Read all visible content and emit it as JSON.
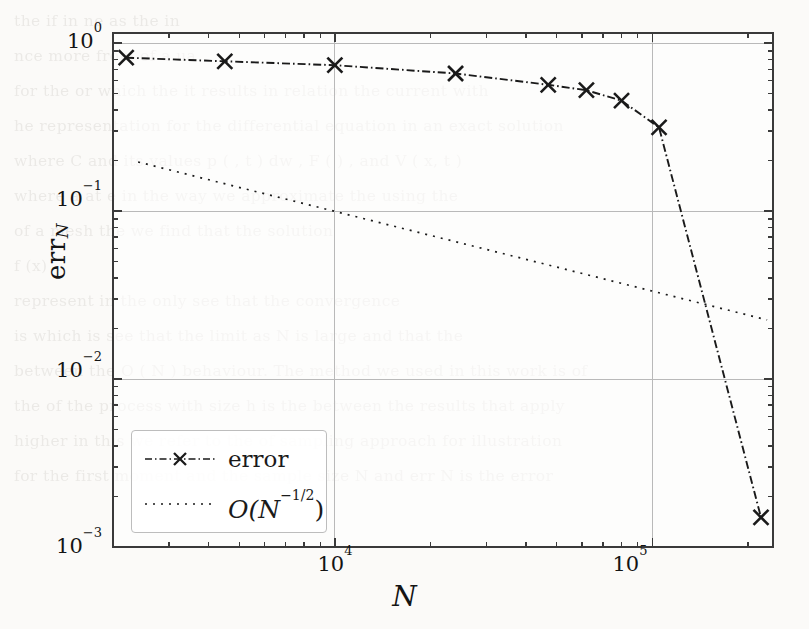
{
  "figure": {
    "y_axis_title": "err",
    "y_axis_title_sub": "N",
    "x_axis_title": "N"
  },
  "ticks": {
    "y": [
      {
        "label_mantissa": "10",
        "label_exponent": "0",
        "value": 1
      },
      {
        "label_mantissa": "10",
        "label_exponent": "−1",
        "value": 0.1
      },
      {
        "label_mantissa": "10",
        "label_exponent": "−2",
        "value": 0.01
      },
      {
        "label_mantissa": "10",
        "label_exponent": "−3",
        "value": 0.001
      }
    ],
    "x": [
      {
        "label_mantissa": "10",
        "label_exponent": "4",
        "value": 10000
      },
      {
        "label_mantissa": "10",
        "label_exponent": "5",
        "value": 100000
      }
    ]
  },
  "legend": {
    "position": "lower-left",
    "entries": [
      {
        "label": "error",
        "style": "dash-dot",
        "marker": "x",
        "color": "#1a1a1a"
      },
      {
        "label_prefix": "O(N",
        "label_exponent": "−1/2",
        "label_suffix": ")",
        "style": "dotted",
        "marker": "none",
        "color": "#1a1a1a"
      }
    ]
  },
  "chart_data": {
    "type": "line",
    "title": "",
    "xlabel": "N",
    "ylabel": "err_N",
    "xscale": "log",
    "yscale": "log",
    "xlim": [
      2000,
      240000
    ],
    "ylim": [
      0.001,
      1.15
    ],
    "grid": true,
    "grid_axes": "both (major decades only)",
    "legend_position": "lower left",
    "series": [
      {
        "name": "error",
        "style": "dash-dot",
        "marker": "x",
        "color": "#1a1a1a",
        "x": [
          2200,
          4500,
          10000,
          24000,
          47000,
          62000,
          80000,
          105000,
          220000
        ],
        "y": [
          0.82,
          0.78,
          0.74,
          0.66,
          0.565,
          0.525,
          0.455,
          0.315,
          0.0015
        ]
      },
      {
        "name": "O(N^-1/2)",
        "style": "dotted",
        "marker": "none",
        "color": "#1a1a1a",
        "x": [
          2400,
          230000
        ],
        "y": [
          0.196,
          0.0225
        ]
      }
    ]
  },
  "ghost_text": [
    "the           if                         in         ne                      as        the         in",
    "              nce        more      from                   of     a             ua",
    "    for     the   or        which   the      it     results   in    relation   the   current   with",
    "    he     representation     for      the     differential   equation   in   an   exact   solution",
    "                                                                                                  ",
    "where     C   and   its   values             p   (   , t )   dw ,   F   (   )     ,      and   V ( x, t )",
    "                                                                                                  ",
    "   where   a           at           e        in   the   way   we   approximate   the     using   the",
    "    of      a   mesh          the     we   find   that   the   solution",
    "                                                                                                  ",
    "                                                   f (x)                                          ",
    "                                                                                                  ",
    "                                                                                                  ",
    "  represent                       in   the   only     see   that   the   convergence                ",
    "   is   which   is                 see   that   the   limit   as   N   is   large   and   that   the",
    "   between   the   O ( N     ) behaviour.   The       method   we   used   in   this   work   is   of",
    "   the   of     the     process   with   size   h   is   the   between   the   results   that   apply",
    "                                                                                                  ",
    "   higher    in   this   we   refer   to     the   of   sampling   approach         for     illustration",
    "   for   the   first   moment   and   the   sample   size   N   and   err     N   is   the   error"
  ]
}
